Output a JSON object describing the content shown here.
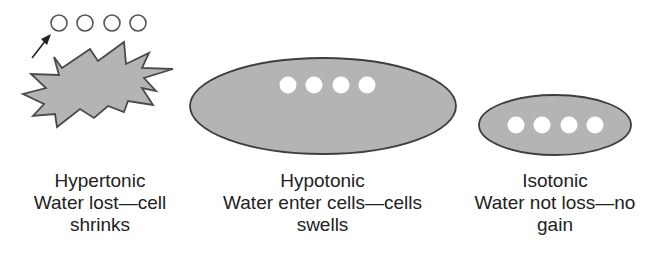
{
  "colors": {
    "cell_fill": "#b4b4b4",
    "cell_stroke": "#4a4a4a",
    "water_dot": "#ffffff",
    "text": "#222222"
  },
  "panels": [
    {
      "id": "hypertonic",
      "title": "Hypertonic",
      "line2": "Water lost—cell",
      "line3": "shrinks",
      "shape": "starburst",
      "water_molecules": 4,
      "water_location": "outside"
    },
    {
      "id": "hypotonic",
      "title": "Hypotonic",
      "line2": "Water enter cells—cells",
      "line3": "swells",
      "shape": "large-ellipse",
      "water_molecules": 4,
      "water_location": "inside"
    },
    {
      "id": "isotonic",
      "title": "Isotonic",
      "line2": "Water not loss—no",
      "line3": "gain",
      "shape": "small-ellipse",
      "water_molecules": 4,
      "water_location": "inside"
    }
  ]
}
